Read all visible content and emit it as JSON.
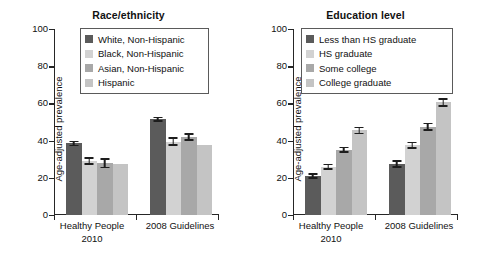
{
  "figure": {
    "background": "#ffffff"
  },
  "palette": {
    "series1": "#5b5b5b",
    "series2": "#d2d2d2",
    "series3": "#a8a8a8",
    "series4": "#c4c4c4",
    "axis": "#262626",
    "text": "#111111",
    "legend_border": "#5a5a5a"
  },
  "chart_data": [
    {
      "type": "bar",
      "title": "Race/ethnicity",
      "xlabel": "",
      "ylabel": "Age-adjusted prevalence",
      "ylim": [
        0,
        100
      ],
      "yticks": [
        0,
        20,
        40,
        60,
        80,
        100
      ],
      "ytick_labels": [
        "0",
        "20",
        "40",
        "60",
        "80",
        "100"
      ],
      "grid": false,
      "legend_position": "top-right-inside",
      "categories": [
        "Healthy People 2010",
        "2008 Guidelines"
      ],
      "category_lines": [
        [
          "Healthy People",
          "2010"
        ],
        [
          "2008 Guidelines"
        ]
      ],
      "series": [
        {
          "name": "White, Non-Hispanic",
          "color": "#5b5b5b",
          "values": [
            38.5,
            51.5
          ],
          "errors": [
            1.5,
            1.3
          ]
        },
        {
          "name": "Black, Non-Hispanic",
          "color": "#d2d2d2",
          "values": [
            29.0,
            39.5
          ],
          "errors": [
            2.0,
            2.3
          ]
        },
        {
          "name": "Asian, Non-Hispanic",
          "color": "#a8a8a8",
          "values": [
            27.8,
            42.0
          ],
          "errors": [
            2.6,
            2.1
          ]
        },
        {
          "name": "Hispanic",
          "color": "#c4c4c4",
          "values": [
            27.5,
            37.5
          ],
          "errors": [
            0,
            0
          ]
        }
      ]
    },
    {
      "type": "bar",
      "title": "Education level",
      "xlabel": "",
      "ylabel": "Age-adjusted prevalence",
      "ylim": [
        0,
        100
      ],
      "yticks": [
        0,
        20,
        40,
        60,
        80,
        100
      ],
      "ytick_labels": [
        "0",
        "20",
        "40",
        "60",
        "80",
        "100"
      ],
      "grid": false,
      "legend_position": "top-right-inside",
      "categories": [
        "Healthy People 2010",
        "2008 Guidelines"
      ],
      "category_lines": [
        [
          "Healthy People",
          "2010"
        ],
        [
          "2008 Guidelines"
        ]
      ],
      "series": [
        {
          "name": "Less than HS graduate",
          "color": "#5b5b5b",
          "values": [
            21.0,
            27.5
          ],
          "errors": [
            1.5,
            2.0
          ]
        },
        {
          "name": "HS graduate",
          "color": "#d2d2d2",
          "values": [
            26.0,
            37.5
          ],
          "errors": [
            1.6,
            1.9
          ]
        },
        {
          "name": "Some college",
          "color": "#a8a8a8",
          "values": [
            35.0,
            47.5
          ],
          "errors": [
            1.7,
            2.1
          ]
        },
        {
          "name": "College graduate",
          "color": "#c4c4c4",
          "values": [
            45.5,
            60.5
          ],
          "errors": [
            2.0,
            2.2
          ]
        }
      ]
    }
  ]
}
